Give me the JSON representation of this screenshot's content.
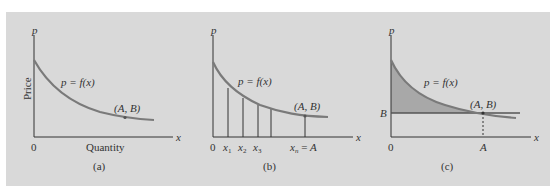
{
  "figure": {
    "background_color": "#d9d9d9",
    "curve_color": "#7a7a7a",
    "shade_color": "#a8a8a8",
    "panels": [
      {
        "id": "a",
        "caption": "(a)",
        "y_axis_label": "p",
        "x_axis_label": "x",
        "y_title": "Price",
        "x_title": "Quantity",
        "origin_label": "0",
        "curve_label": "p = f(x)",
        "point_label": "(A, B)"
      },
      {
        "id": "b",
        "caption": "(b)",
        "y_axis_label": "p",
        "x_axis_label": "x",
        "origin_label": "0",
        "curve_label": "p = f(x)",
        "point_label": "(A, B)",
        "ticks": [
          "x1",
          "x2",
          "x3",
          "xn = A"
        ],
        "tick_parts": [
          {
            "base": "x",
            "sub": "1"
          },
          {
            "base": "x",
            "sub": "2"
          },
          {
            "base": "x",
            "sub": "3"
          },
          {
            "base": "x",
            "sub": "n",
            "suffix": " = A"
          }
        ]
      },
      {
        "id": "c",
        "caption": "(c)",
        "y_axis_label": "p",
        "x_axis_label": "x",
        "origin_label": "0",
        "curve_label": "p = f(x)",
        "point_label": "(A, B)",
        "y_tick_label": "B",
        "x_tick_label": "A"
      }
    ]
  }
}
